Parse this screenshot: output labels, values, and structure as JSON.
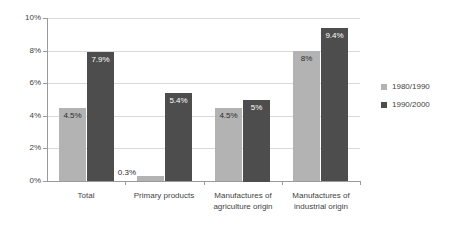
{
  "chart_data": {
    "type": "bar",
    "title": "",
    "subtitle": "",
    "xlabel": "",
    "ylabel": "",
    "ylim": [
      0,
      10
    ],
    "y_ticks": [
      0,
      2,
      4,
      6,
      8,
      10
    ],
    "y_tick_labels": [
      "0%",
      "2%",
      "4%",
      "6%",
      "8%",
      "10%"
    ],
    "grid": true,
    "legend_position": "right",
    "categories": [
      "Total",
      "Primary products",
      "Manufactures of\nagriculture origin",
      "Manufactures of\nindustrial origin"
    ],
    "series": [
      {
        "name": "1980/1990",
        "color": "#b3b3b3",
        "values": [
          4.5,
          0.3,
          4.5,
          8.0
        ],
        "value_labels": [
          "4.5%",
          "0.3%",
          "4.5%",
          "8%"
        ]
      },
      {
        "name": "1990/2000",
        "color": "#4d4d4d",
        "values": [
          7.9,
          5.4,
          5.0,
          9.4
        ],
        "value_labels": [
          "7.9%",
          "5.4%",
          "5%",
          "9.4%"
        ]
      }
    ]
  },
  "legend": {
    "items": [
      {
        "label": "1980/1990",
        "color": "#b3b3b3"
      },
      {
        "label": "1990/2000",
        "color": "#4d4d4d"
      }
    ]
  },
  "colors": {
    "series_1980_1990": "#b3b3b3",
    "series_1990_2000": "#4d4d4d",
    "gridline": "#d9d9d9",
    "axis": "#9a9a9a",
    "text": "#3f3f3f",
    "background": "#ffffff"
  }
}
